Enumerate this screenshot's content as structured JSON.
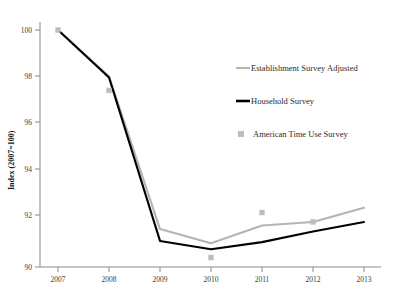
{
  "chart_data": {
    "type": "line",
    "title": "",
    "xlabel": "",
    "ylabel": "Index (2007=100)",
    "x": [
      2007,
      2008,
      2009,
      2010,
      2011,
      2012,
      2013
    ],
    "xticklabels": [
      "2007",
      "2008",
      "2009",
      "2010",
      "2011",
      "2012",
      "2013"
    ],
    "yticklabels": [
      "90",
      "92",
      "94",
      "96",
      "98",
      "100"
    ],
    "ylim": [
      89.6,
      100.6
    ],
    "xlim": [
      2006.6,
      2013.4
    ],
    "grid": false,
    "legend_position": "center-right-inside",
    "series": [
      {
        "name": "Establishment Survey Adjusted",
        "style": "line",
        "color": "#b4b4b4",
        "values": [
          100.0,
          98.05,
          91.6,
          91.0,
          91.75,
          91.9,
          92.5
        ]
      },
      {
        "name": "Household Survey",
        "style": "line",
        "color": "#000000",
        "values": [
          100.0,
          98.0,
          91.1,
          90.75,
          91.05,
          91.5,
          91.9
        ]
      },
      {
        "name": "American Time Use Survey",
        "style": "marker",
        "color": "#bdbdbd",
        "x": [
          2007,
          2008,
          2010,
          2011,
          2012
        ],
        "values": [
          100.0,
          97.45,
          90.4,
          92.3,
          91.9
        ]
      }
    ]
  },
  "legend": {
    "items": [
      {
        "label": "Establishment Survey Adjusted",
        "marker": "line-grey"
      },
      {
        "label": "Household Survey",
        "marker": "line-black"
      },
      {
        "label": "American Time Use Survey",
        "marker": "square-grey"
      }
    ]
  },
  "axis": {
    "y_title": "Index (2007=100)"
  }
}
